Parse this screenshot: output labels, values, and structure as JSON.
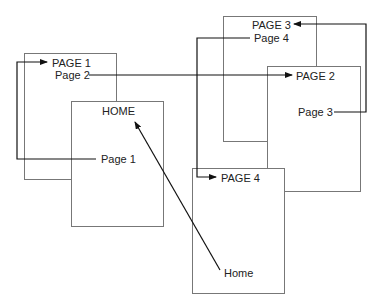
{
  "diagram": {
    "pages": [
      {
        "id": "page1",
        "title": "PAGE 1",
        "links": [
          {
            "label": "Page 2",
            "target": "page2"
          }
        ]
      },
      {
        "id": "home",
        "title": "HOME",
        "links": [
          {
            "label": "Page 1",
            "target": "page1"
          }
        ]
      },
      {
        "id": "page3",
        "title": "PAGE 3",
        "links": [
          {
            "label": "Page 4",
            "target": "page4"
          }
        ]
      },
      {
        "id": "page2",
        "title": "PAGE 2",
        "links": [
          {
            "label": "Page 3",
            "target": "page3"
          }
        ]
      },
      {
        "id": "page4",
        "title": "PAGE 4",
        "links": [
          {
            "label": "Home",
            "target": "home"
          }
        ]
      }
    ]
  }
}
